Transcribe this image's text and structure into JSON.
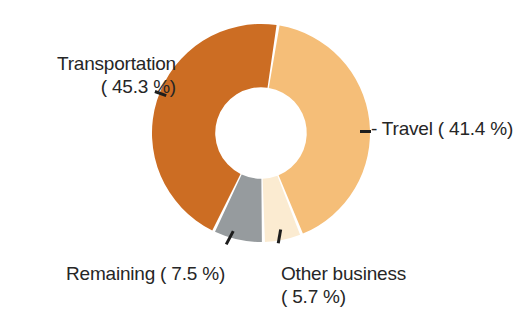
{
  "figure": {
    "background_color": "#ffffff",
    "text_color": "#262626"
  },
  "chart_data": {
    "type": "pie",
    "variant": "donut",
    "title": "",
    "subtitle": "",
    "xlabel": "",
    "ylabel": "",
    "grid": false,
    "legend_position": "none",
    "label_style": "outside-with-leader-lines",
    "units": "percent",
    "total": 99.9,
    "start_angle_deg": 9,
    "direction": "clockwise",
    "inner_radius_ratio": 0.42,
    "categories": [
      "Travel",
      "Other business",
      "Remaining",
      "Transportation"
    ],
    "values": [
      41.4,
      5.7,
      7.5,
      45.3
    ],
    "colors": [
      "#F5BE78",
      "#FBEBD1",
      "#969B9E",
      "#CC6D23"
    ],
    "slices": [
      {
        "name": "Travel",
        "label": "Travel",
        "value": 41.4,
        "value_text": "41.4 %",
        "display_text": "Travel ( 41.4 %)",
        "color": "#F5BE78",
        "label_position": "right"
      },
      {
        "name": "Other business",
        "label": "Other business",
        "value": 5.7,
        "value_text": "5.7 %",
        "display_text": "Other business ( 5.7 %)",
        "color": "#FBEBD1",
        "label_position": "bottom-right"
      },
      {
        "name": "Remaining",
        "label": "Remaining",
        "value": 7.5,
        "value_text": "7.5 %",
        "display_text": "Remaining ( 7.5 %)",
        "color": "#969B9E",
        "label_position": "bottom-left"
      },
      {
        "name": "Transportation",
        "label": "Transportation",
        "value": 45.3,
        "value_text": "45.3 %",
        "display_text": "Transportation ( 45.3 %)",
        "color": "#CC6D23",
        "label_position": "left"
      }
    ]
  },
  "labels": {
    "transportation": {
      "line1": "Transportation",
      "line2": "( 45.3 %)"
    },
    "travel": {
      "line1": "- Travel ( 41.4 %)"
    },
    "remaining": {
      "line1": "Remaining ( 7.5 %)"
    },
    "other_business": {
      "line1": "Other business",
      "line2": "( 5.7 %)"
    }
  }
}
